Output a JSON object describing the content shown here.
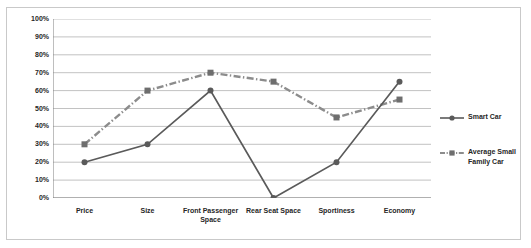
{
  "chart_data": {
    "type": "line",
    "title": "",
    "xlabel": "",
    "ylabel": "",
    "categories": [
      "Price",
      "Size",
      "Front Passenger Space",
      "Rear Seat Space",
      "Sportiness",
      "Economy"
    ],
    "ylim": [
      0,
      100
    ],
    "ytick_labels": [
      "100%",
      "90%",
      "80%",
      "70%",
      "60%",
      "50%",
      "40%",
      "30%",
      "20%",
      "10%",
      "0%"
    ],
    "ytick_values": [
      100,
      90,
      80,
      70,
      60,
      50,
      40,
      30,
      20,
      10,
      0
    ],
    "grid": true,
    "legend_position": "right",
    "series": [
      {
        "name": "Smart Car",
        "values": [
          20,
          30,
          60,
          0,
          20,
          65
        ],
        "color": "#5a5a5a",
        "marker": "circle",
        "line_style": "solid"
      },
      {
        "name": "Average Small Family Car",
        "values": [
          30,
          60,
          70,
          65,
          45,
          55
        ],
        "color": "#8c8c8c",
        "marker": "square",
        "line_style": "dash-dot"
      }
    ]
  },
  "legend": {
    "items": [
      {
        "label": "Smart Car"
      },
      {
        "label": "Average Small Family Car"
      }
    ]
  },
  "colors": {
    "series_smart": "#5a5a5a",
    "series_average": "#8c8c8c",
    "gridline": "#b3b3b3",
    "axis": "#7f7f7f",
    "text": "#262626",
    "frame": "#c9c9c9",
    "background": "#ffffff"
  }
}
